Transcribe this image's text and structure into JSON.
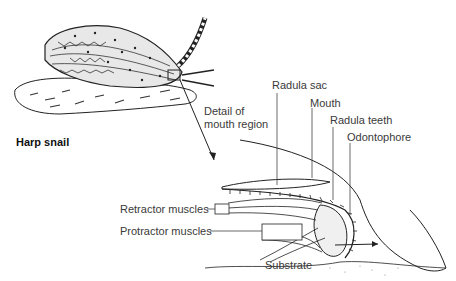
{
  "diagram": {
    "title": "Harp snail",
    "detail_caption": [
      "Detail of",
      "mouth region"
    ],
    "labels": {
      "radula_sac": "Radula sac",
      "mouth": "Mouth",
      "radula_teeth": "Radula teeth",
      "odontophore": "Odontophore",
      "retractor_muscles": "Retractor muscles",
      "protractor_muscles": "Protractor muscles",
      "substrate": "Substrate"
    },
    "colors": {
      "line": "#222222",
      "text": "#3a3a3a",
      "background": "#ffffff"
    }
  }
}
